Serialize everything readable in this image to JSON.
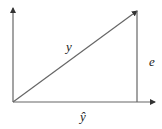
{
  "diagram": {
    "type": "vector-projection",
    "line_color": "#555555",
    "labels": {
      "hypotenuse": "y",
      "vertical": "e",
      "base": "ŷ"
    }
  }
}
